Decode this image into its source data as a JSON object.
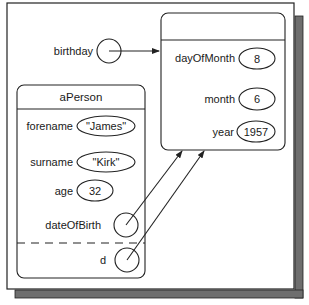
{
  "diagram": {
    "colors": {
      "line": "#222222",
      "shadow": "#6e6e6e",
      "background": "#ffffff"
    },
    "birthday": {
      "label": "birthday"
    },
    "date_object": {
      "title": "",
      "fields": [
        {
          "name": "dayOfMonth",
          "value": "8"
        },
        {
          "name": "month",
          "value": "6"
        },
        {
          "name": "year",
          "value": "1957"
        }
      ]
    },
    "person_object": {
      "title": "aPerson",
      "fields": [
        {
          "name": "forename",
          "value": "\"James\""
        },
        {
          "name": "surname",
          "value": "\"Kirk\""
        },
        {
          "name": "age",
          "value": "32"
        },
        {
          "name": "dateOfBirth",
          "value": ""
        }
      ],
      "local": {
        "name": "d",
        "value": ""
      }
    }
  }
}
